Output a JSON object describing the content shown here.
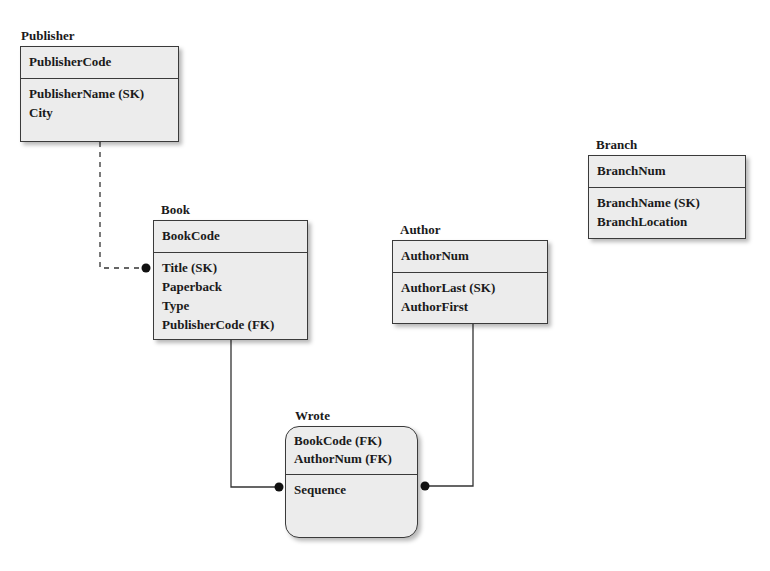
{
  "entities": {
    "publisher": {
      "name": "Publisher",
      "primary_key": [
        "PublisherCode"
      ],
      "attributes": [
        "PublisherName (SK)",
        "City"
      ]
    },
    "book": {
      "name": "Book",
      "primary_key": [
        "BookCode"
      ],
      "attributes": [
        "Title (SK)",
        "Paperback",
        "Type",
        "PublisherCode (FK)"
      ]
    },
    "author": {
      "name": "Author",
      "primary_key": [
        "AuthorNum"
      ],
      "attributes": [
        "AuthorLast (SK)",
        "AuthorFirst"
      ]
    },
    "branch": {
      "name": "Branch",
      "primary_key": [
        "BranchNum"
      ],
      "attributes": [
        "BranchName (SK)",
        "BranchLocation"
      ]
    },
    "wrote": {
      "name": "Wrote",
      "primary_key": [
        "BookCode (FK)",
        "AuthorNum (FK)"
      ],
      "attributes": [
        "Sequence"
      ]
    }
  },
  "relationships": [
    {
      "from": "Publisher",
      "to": "Book",
      "style": "dashed",
      "end": "dot"
    },
    {
      "from": "Book",
      "to": "Wrote",
      "style": "solid",
      "end": "dot"
    },
    {
      "from": "Author",
      "to": "Wrote",
      "style": "solid",
      "end": "dot"
    }
  ]
}
